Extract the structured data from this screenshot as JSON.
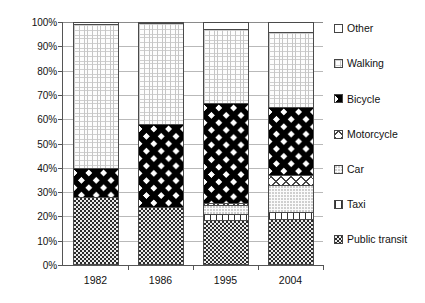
{
  "chart_data": {
    "type": "bar",
    "subtype": "stacked-percentage-column",
    "title": "",
    "xlabel": "",
    "ylabel": "",
    "categories": [
      "1982",
      "1986",
      "1995",
      "2004"
    ],
    "ylim": [
      0,
      100
    ],
    "ytick_labels": [
      "0%",
      "10%",
      "20%",
      "30%",
      "40%",
      "50%",
      "60%",
      "70%",
      "80%",
      "90%",
      "100%"
    ],
    "ytick_values": [
      0,
      10,
      20,
      30,
      40,
      50,
      60,
      70,
      80,
      90,
      100
    ],
    "grid": true,
    "legend_position": "right",
    "stack_order_bottom_to_top": [
      "Public transit",
      "Taxi",
      "Car",
      "Motorcycle",
      "Bicycle",
      "Walking",
      "Other"
    ],
    "series": [
      {
        "name": "Public transit",
        "pattern": "dark-dotted",
        "values": [
          28,
          24,
          18.5,
          19
        ]
      },
      {
        "name": "Taxi",
        "pattern": "vertical-stripes",
        "values": [
          0,
          0,
          2.5,
          3
        ]
      },
      {
        "name": "Car",
        "pattern": "light-dotted",
        "values": [
          0,
          0,
          3.5,
          11
        ]
      },
      {
        "name": "Motorcycle",
        "pattern": "diagonal-crosshatch",
        "values": [
          0,
          0,
          1,
          4
        ]
      },
      {
        "name": "Bicycle",
        "pattern": "diamond-checker",
        "values": [
          12,
          34,
          41,
          28
        ]
      },
      {
        "name": "Walking",
        "pattern": "fine-grid",
        "values": [
          59,
          41.5,
          30.5,
          31
        ]
      },
      {
        "name": "Other",
        "pattern": "solid-white",
        "values": [
          1,
          0.5,
          3,
          4
        ]
      }
    ]
  },
  "legend": {
    "items": [
      {
        "label": "Other",
        "pattern": "solid-white"
      },
      {
        "label": "Walking",
        "pattern": "fine-grid"
      },
      {
        "label": "Bicycle",
        "pattern": "diamond-checker"
      },
      {
        "label": "Motorcycle",
        "pattern": "diagonal-crosshatch"
      },
      {
        "label": "Car",
        "pattern": "light-dotted"
      },
      {
        "label": "Taxi",
        "pattern": "vertical-stripes"
      },
      {
        "label": "Public transit",
        "pattern": "dark-dotted"
      }
    ]
  },
  "colors": {
    "axis": "#555555",
    "gridline": "#b9b9b9",
    "bar_outline": "#4a4a4a",
    "text": "#111111",
    "background": "#ffffff"
  }
}
